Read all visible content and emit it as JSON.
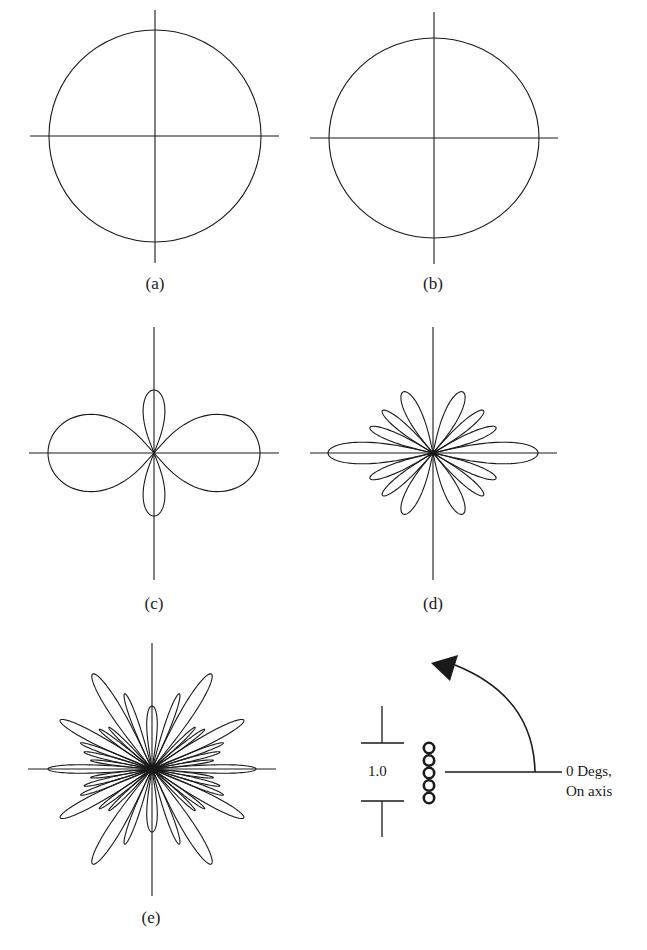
{
  "figure": {
    "panels": [
      {
        "id": "a",
        "label": "(a)",
        "shape": "circle",
        "cx": 155,
        "cy": 136,
        "rx": 106,
        "ry": 106,
        "axis": {
          "x1": 30,
          "x2": 279,
          "y1": 10,
          "y2": 263
        }
      },
      {
        "id": "b",
        "label": "(b)",
        "shape": "ellipse",
        "cx": 434,
        "cy": 138,
        "rx": 105,
        "ry": 100,
        "axis": {
          "x1": 310,
          "x2": 558,
          "y1": 12,
          "y2": 264
        }
      },
      {
        "id": "c",
        "label": "(c)",
        "shape": "polar-lobes",
        "cx": 154,
        "cy": 453,
        "axis": {
          "x1": 29,
          "x2": 279,
          "y1": 327,
          "y2": 580
        }
      },
      {
        "id": "d",
        "label": "(d)",
        "shape": "polar-lobes",
        "cx": 433,
        "cy": 453,
        "axis": {
          "x1": 310,
          "x2": 557,
          "y1": 327,
          "y2": 580
        }
      },
      {
        "id": "e",
        "label": "(e)",
        "shape": "polar-lobes",
        "cx": 152,
        "cy": 769,
        "axis": {
          "x1": 28,
          "x2": 276,
          "y1": 643,
          "y2": 896
        }
      }
    ],
    "legend": {
      "scale_value": "1.0",
      "angle_label_line1": "0 Degs,",
      "angle_label_line2": "On axis",
      "coil_turns": 5
    }
  }
}
